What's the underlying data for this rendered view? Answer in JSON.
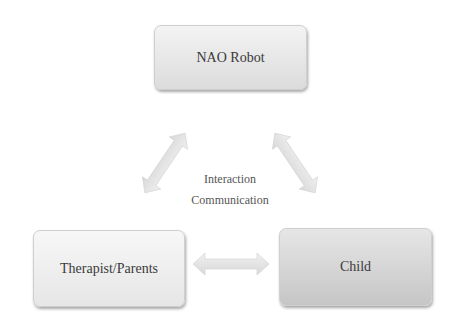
{
  "diagram": {
    "nodes": {
      "robot": "NAO Robot",
      "therapist": "Therapist/Parents",
      "child": "Child"
    },
    "edge_labels": {
      "line1": "Interaction",
      "line2": "Communication"
    },
    "edges": [
      {
        "from": "NAO Robot",
        "to": "Therapist/Parents",
        "type": "bidirectional"
      },
      {
        "from": "NAO Robot",
        "to": "Child",
        "type": "bidirectional"
      },
      {
        "from": "Therapist/Parents",
        "to": "Child",
        "type": "bidirectional"
      }
    ],
    "colors": {
      "box_light": "#f3f3f3",
      "box_dark": "#c6c6c6",
      "arrow": "#e2e2e2",
      "text": "#3a3a3a"
    }
  }
}
